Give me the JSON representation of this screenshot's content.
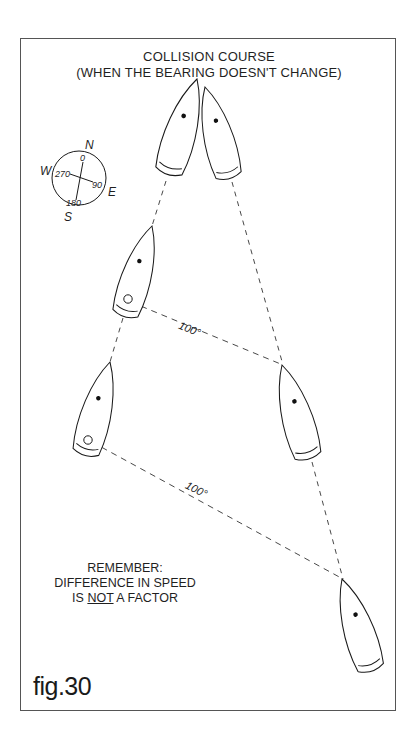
{
  "figure": {
    "title_line1": "COLLISION COURSE",
    "title_line2": "(WHEN THE BEARING DOESN'T CHANGE)",
    "caption": "fig.30"
  },
  "compass": {
    "north": "N",
    "east": "E",
    "south": "S",
    "west": "W",
    "deg_north": "0",
    "deg_east": "90",
    "deg_south": "180",
    "deg_west": "270"
  },
  "bearings": [
    {
      "label": "100°"
    },
    {
      "label": "100°"
    }
  ],
  "note": {
    "line1": "REMEMBER:",
    "line2": "DIFFERENCE IN SPEED",
    "line3_pre": "IS ",
    "line3_underlined": "NOT",
    "line3_post": " A FACTOR"
  },
  "colors": {
    "ink": "#1a1a1a",
    "background": "#ffffff",
    "frame": "#555555"
  }
}
